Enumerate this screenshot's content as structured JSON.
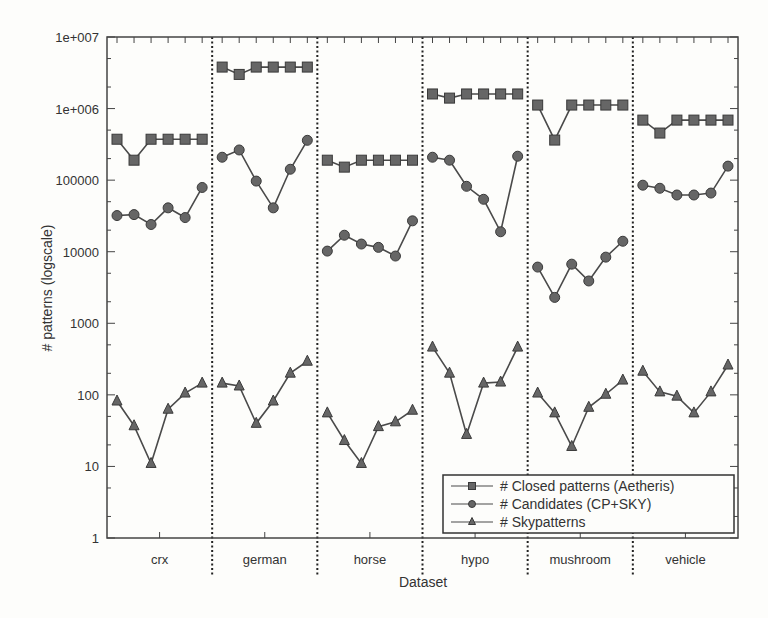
{
  "chart_data": {
    "type": "line",
    "title": "",
    "xlabel": "Dataset",
    "ylabel": "# patterns (logscale)",
    "yscale": "log",
    "ylim": [
      1,
      10000000
    ],
    "y_ticks": [
      "1",
      "10",
      "100",
      "1000",
      "10000",
      "100000",
      "1e+006",
      "1e+007"
    ],
    "grid": false,
    "legend_position": "lower right",
    "categories": [
      "crx",
      "german",
      "horse",
      "hypo",
      "mushroom",
      "vehicle"
    ],
    "points_per_category": 6,
    "series": [
      {
        "name": "# Closed patterns (Aetheris)",
        "marker": "square",
        "values": {
          "crx": [
            373000,
            190000,
            373000,
            373000,
            373000,
            373000
          ],
          "german": [
            3800000,
            3000000,
            3800000,
            3800000,
            3800000,
            3800000
          ],
          "horse": [
            190000,
            152000,
            190000,
            190000,
            190000,
            190000
          ],
          "hypo": [
            1600000,
            1400000,
            1600000,
            1600000,
            1600000,
            1600000
          ],
          "mushroom": [
            1120000,
            363000,
            1120000,
            1120000,
            1120000,
            1120000
          ],
          "vehicle": [
            690000,
            455000,
            690000,
            690000,
            690000,
            690000
          ]
        }
      },
      {
        "name": "# Candidates (CP+SKY)",
        "marker": "circle",
        "values": {
          "crx": [
            32000,
            33000,
            24000,
            41000,
            30000,
            79000
          ],
          "german": [
            209000,
            264000,
            97000,
            41000,
            142000,
            360000
          ],
          "horse": [
            10200,
            17000,
            12800,
            11500,
            8700,
            27000
          ],
          "hypo": [
            209000,
            190000,
            82000,
            54000,
            19000,
            216000
          ],
          "mushroom": [
            6100,
            2300,
            6700,
            3900,
            8400,
            14000
          ],
          "vehicle": [
            85000,
            77000,
            62000,
            62000,
            66000,
            157000
          ]
        }
      },
      {
        "name": "# Skypatterns",
        "marker": "triangle",
        "values": {
          "crx": [
            82,
            37,
            11,
            63,
            106,
            146
          ],
          "german": [
            146,
            133,
            40,
            82,
            201,
            295
          ],
          "horse": [
            56,
            23,
            11,
            36,
            42,
            61
          ],
          "hypo": [
            465,
            201,
            28,
            146,
            151,
            465
          ],
          "mushroom": [
            106,
            56,
            19,
            67,
            102,
            161
          ],
          "vehicle": [
            214,
            110,
            96,
            56,
            110,
            261
          ]
        }
      }
    ]
  },
  "colors": {
    "line": "#4a4a4a",
    "marker_fill": "#666666",
    "marker_stroke": "#3a3a3a",
    "frame": "#444444",
    "divider": "#222222"
  }
}
